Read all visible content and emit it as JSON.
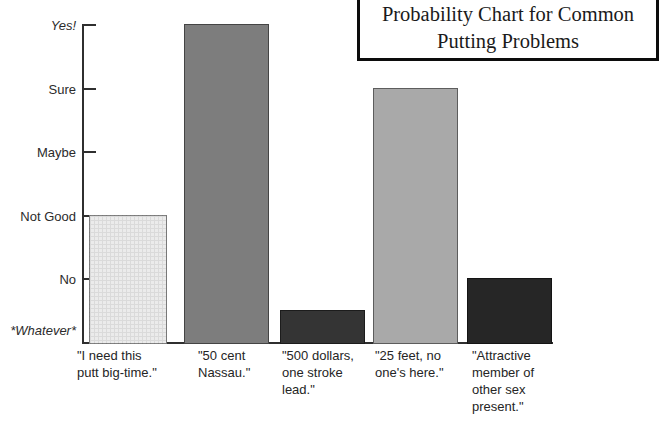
{
  "title_box": {
    "lines": [
      "Probability Chart for Common",
      "Putting Problems"
    ]
  },
  "chart_data": {
    "type": "bar",
    "title": "Probability Chart for Common Putting Problems",
    "categories": [
      "\"I need this putt big-time.\"",
      "\"50 cent Nassau.\"",
      "\"500 dollars, one stroke lead.\"",
      "\"25 feet, no one's here.\"",
      "\"Attractive member of other sex present.\""
    ],
    "category_label_lines": [
      [
        "\"I need this",
        "putt big-time.\""
      ],
      [
        "\"50 cent",
        "Nassau.\""
      ],
      [
        "\"500 dollars,",
        "one stroke",
        "lead.\""
      ],
      [
        "\"25 feet, no",
        "one's here.\""
      ],
      [
        "\"Attractive",
        "member of",
        "other sex",
        "present.\""
      ]
    ],
    "y_tick_labels": [
      "*Whatever*",
      "No",
      "Not Good",
      "Maybe",
      "Sure",
      "Yes!"
    ],
    "y_tick_italic": [
      true,
      false,
      false,
      false,
      false,
      true
    ],
    "values": [
      2,
      5,
      0.5,
      4,
      1
    ],
    "value_scale": {
      "min": 0,
      "max": 5
    },
    "bar_colors": [
      "#ebebeb",
      "#7d7d7d",
      "#343434",
      "#a9a9a9",
      "#262626"
    ],
    "bar_patterns": [
      "grid",
      "none",
      "none",
      "none",
      "none"
    ],
    "axis_color": "#2f2f2f",
    "grid": false,
    "legend": false
  }
}
